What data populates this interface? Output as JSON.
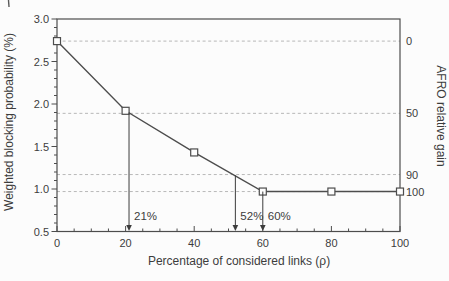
{
  "figure": {
    "background": "#fcfcfc",
    "frame_color": "#4d4d4d",
    "grid_color": "#b8b8b8",
    "line_color": "#4d4d4d",
    "marker_fill": "#fdfdfd",
    "text_color": "#3c3c3c"
  },
  "chart_data": {
    "type": "line",
    "title": "",
    "xlabel": "Percentage of considered links (ρ)",
    "ylabel_left": "Weighted blocking probability (%)",
    "ylabel_right": "AFRO relative gain",
    "xlim": [
      0,
      100
    ],
    "ylim_left": [
      0.5,
      3.0
    ],
    "x_ticks_major": [
      0,
      20,
      40,
      60,
      80,
      100
    ],
    "x_tick_minor_step": 5,
    "y_ticks_major_left": [
      "0.5",
      "1.0",
      "1.5",
      "2.0",
      "2.5",
      "3.0"
    ],
    "y_tick_minor_step_left": 0.1,
    "grid": "horizontal dashed lines at right-axis gain levels",
    "legend": "none",
    "series": [
      {
        "name": "weighted-blocking-probability",
        "marker": "open-square",
        "x": [
          0,
          20,
          40,
          60,
          80,
          100
        ],
        "y": [
          2.74,
          1.92,
          1.43,
          0.97,
          0.97,
          0.97
        ]
      }
    ],
    "right_axis_gridlines": [
      {
        "gain_label": "0",
        "value": 2.74
      },
      {
        "gain_label": "50",
        "value": 1.89
      },
      {
        "gain_label": "90",
        "value": 1.17
      },
      {
        "gain_label": "100",
        "value": 0.97
      }
    ],
    "annotations": [
      {
        "label": "21%",
        "x": 21,
        "y_top": 1.9
      },
      {
        "label": "52%",
        "x": 52,
        "y_top": 1.16
      },
      {
        "label": "60%",
        "x": 60,
        "y_top": 0.97
      }
    ]
  }
}
